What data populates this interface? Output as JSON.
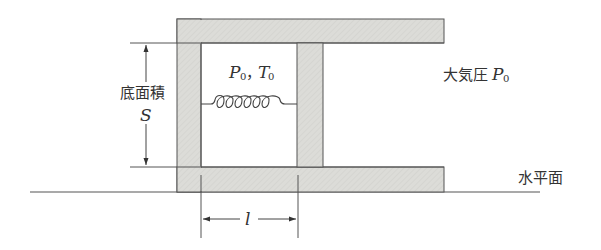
{
  "diagram": {
    "type": "cylinder-piston-spring",
    "gas_label": {
      "P": "P",
      "P_sub": "0",
      "sep": "，",
      "T": "T",
      "T_sub": "0"
    },
    "atmosphere_label": {
      "text": "大気圧",
      "P": "P",
      "P_sub": "0"
    },
    "area_label": {
      "text": "底面積",
      "symbol": "S"
    },
    "length_label": "l",
    "ground_label": "水平面",
    "colors": {
      "wall_fill": "#dcdcd8",
      "stroke": "#555555",
      "text": "#333333"
    }
  }
}
